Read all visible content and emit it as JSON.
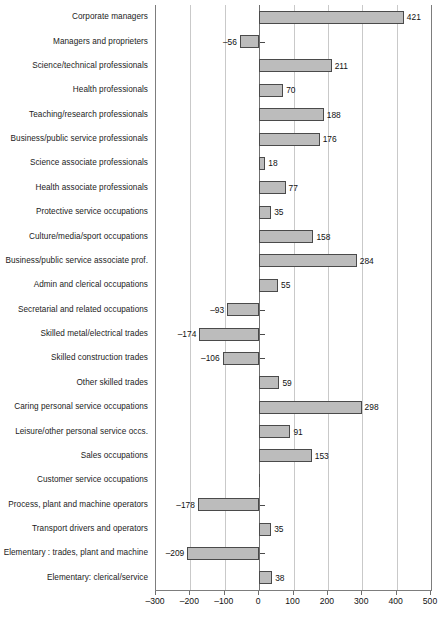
{
  "chart_data": {
    "type": "bar",
    "orientation": "horizontal",
    "title": "",
    "subtitle": "",
    "xlabel": "",
    "ylabel": "",
    "xlim": [
      -300,
      500
    ],
    "xticks": [
      -300,
      -200,
      -100,
      0,
      100,
      200,
      300,
      400,
      500
    ],
    "xtick_labels": [
      "–300",
      "–200",
      "–100",
      "0",
      "100",
      "200",
      "300",
      "400",
      "500"
    ],
    "grid": "vertical",
    "legend": null,
    "bar_color": "#bcbcbc",
    "bar_edge_color": "#4a4a4a",
    "axis_color": "#7d7d7d",
    "gridline_color": "#c9c9c9",
    "categories": [
      "Corporate managers",
      "Managers and proprieters",
      "Science/technical professionals",
      "Health professionals",
      "Teaching/research professionals",
      "Business/public service professionals",
      "Science associate professionals",
      "Health associate professionals",
      "Protective service occupations",
      "Culture/media/sport occupations",
      "Business/public service associate prof.",
      "Admin and clerical occupations",
      "Secretarial and related occupations",
      "Skilled metal/electrical trades",
      "Skilled construction trades",
      "Other skilled trades",
      "Caring personal service occupations",
      "Leisure/other personal service occs.",
      "Sales occupations",
      "Customer service occupations",
      "Process, plant and machine operators",
      "Transport drivers and operators",
      "Elementary : trades, plant and machine",
      "Elementary: clerical/service"
    ],
    "values": [
      421,
      -56,
      211,
      70,
      188,
      176,
      18,
      77,
      35,
      158,
      284,
      55,
      -93,
      -174,
      -106,
      59,
      298,
      91,
      153,
      0,
      -178,
      35,
      -209,
      38
    ],
    "value_labels": [
      "421",
      "–56",
      "211",
      "70",
      "188",
      "176",
      "18",
      "77",
      "35",
      "158",
      "284",
      "55",
      "–93",
      "–174",
      "–106",
      "59",
      "298",
      "91",
      "153",
      "",
      "–178",
      "35",
      "–209",
      "38"
    ]
  }
}
